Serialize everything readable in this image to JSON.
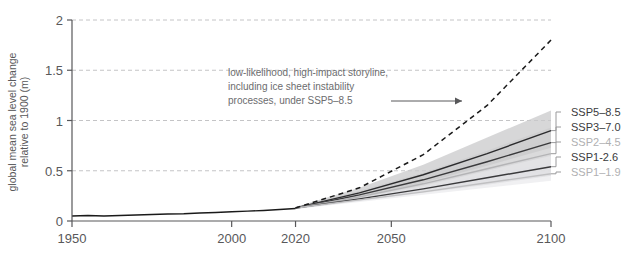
{
  "chart_data": {
    "type": "line",
    "title": "",
    "subtitle": "",
    "xlabel": "",
    "ylabel": "global mean sea level change relative to 1900 (m)",
    "xlim": [
      1950,
      2100
    ],
    "ylim": [
      0,
      2
    ],
    "xticks": [
      "1950",
      "2000",
      "2020",
      "2050",
      "2100"
    ],
    "xtick_values": [
      1950,
      2000,
      2020,
      2050,
      2100
    ],
    "yticks": [
      "0",
      "0.5",
      "1",
      "1.5",
      "2"
    ],
    "ytick_values": [
      0,
      0.5,
      1,
      1.5,
      2
    ],
    "grid": "horizontal-dashed",
    "legend_position": "right",
    "annotations": [
      {
        "name": "low-likelihood-storyline",
        "line1": "low-likelihood, high-impact storyline,",
        "line2": "including ice sheet instability",
        "line3": "processes, under SSP5–8.5",
        "arrow": "right"
      }
    ],
    "historical": {
      "name": "observed",
      "color": "#1a1a1a",
      "x": [
        1950,
        1955,
        1960,
        1965,
        1970,
        1975,
        1980,
        1985,
        1990,
        1995,
        2000,
        2005,
        2010,
        2015,
        2020
      ],
      "values": [
        0.05,
        0.055,
        0.05,
        0.055,
        0.06,
        0.065,
        0.07,
        0.072,
        0.08,
        0.085,
        0.092,
        0.098,
        0.105,
        0.115,
        0.125
      ]
    },
    "storyline": {
      "name": "low-likelihood, high-impact storyline under SSP5-8.5",
      "style": "dashed",
      "color": "#1a1a1a",
      "x": [
        2020,
        2040,
        2060,
        2080,
        2100
      ],
      "values": [
        0.13,
        0.33,
        0.66,
        1.15,
        1.8
      ]
    },
    "series": [
      {
        "name": "SSP5–8.5",
        "label": "SSP5–8.5",
        "color": "#2b2b2d",
        "band_color": "#c9c9cb",
        "x": [
          2020,
          2040,
          2060,
          2080,
          2100
        ],
        "values": [
          0.13,
          0.28,
          0.46,
          0.67,
          0.9
        ],
        "band_low": [
          0.12,
          0.24,
          0.38,
          0.55,
          0.73
        ],
        "band_high": [
          0.14,
          0.33,
          0.56,
          0.83,
          1.1
        ]
      },
      {
        "name": "SSP3–7.0",
        "label": "SSP3–7.0",
        "color": "#3a3a3c",
        "band_color": "#d4d4d6",
        "x": [
          2020,
          2040,
          2060,
          2080,
          2100
        ],
        "values": [
          0.13,
          0.26,
          0.41,
          0.59,
          0.78
        ],
        "band_low": [
          0.12,
          0.23,
          0.35,
          0.5,
          0.65
        ],
        "band_high": [
          0.14,
          0.3,
          0.48,
          0.7,
          0.93
        ]
      },
      {
        "name": "SSP2–4.5",
        "label": "SSP2–4.5",
        "color": "#b4b4b6",
        "band_color": "#e2e2e4",
        "x": [
          2020,
          2040,
          2060,
          2080,
          2100
        ],
        "values": [
          0.13,
          0.24,
          0.37,
          0.52,
          0.67
        ],
        "band_low": [
          0.12,
          0.21,
          0.31,
          0.43,
          0.55
        ],
        "band_high": [
          0.14,
          0.28,
          0.44,
          0.63,
          0.82
        ]
      },
      {
        "name": "SSP1‐2.6",
        "label": "SSP1-2.6",
        "color": "#3a3a3c",
        "band_color": "#dedee0",
        "x": [
          2020,
          2040,
          2060,
          2080,
          2100
        ],
        "values": [
          0.13,
          0.22,
          0.32,
          0.43,
          0.54
        ],
        "band_low": [
          0.12,
          0.2,
          0.28,
          0.36,
          0.45
        ],
        "band_high": [
          0.14,
          0.25,
          0.38,
          0.52,
          0.66
        ]
      },
      {
        "name": "SSP1–1.9",
        "label": "SSP1–1.9",
        "color": "#c0c0c2",
        "band_color": "#ebebed",
        "x": [
          2020,
          2040,
          2060,
          2080,
          2100
        ],
        "values": [
          0.13,
          0.21,
          0.29,
          0.38,
          0.47
        ],
        "band_low": [
          0.12,
          0.19,
          0.26,
          0.33,
          0.4
        ],
        "band_high": [
          0.14,
          0.24,
          0.34,
          0.46,
          0.58
        ]
      }
    ]
  }
}
